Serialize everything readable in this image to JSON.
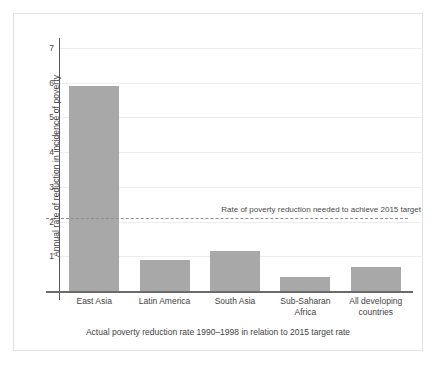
{
  "chart_data": {
    "type": "bar",
    "title": "",
    "subtitle": "",
    "xlabel": "Actual poverty reduction rate 1990–1998 in relation to 2015 target rate",
    "ylabel": "Annual rate of reduction in incidence of poverty",
    "categories": [
      "East Asia",
      "Latin America",
      "South Asia",
      "Sub-Saharan Africa",
      "All developing countries"
    ],
    "category_lines": [
      [
        "East Asia"
      ],
      [
        "Latin America"
      ],
      [
        "South Asia"
      ],
      [
        "Sub-Saharan",
        "Africa"
      ],
      [
        "All developing",
        "countries"
      ]
    ],
    "values": [
      5.9,
      0.9,
      1.15,
      0.4,
      0.7
    ],
    "ylim": [
      0,
      7.2
    ],
    "yticks": [
      1,
      2,
      3,
      4,
      5,
      6,
      7
    ],
    "ytick_labels": [
      "1",
      "2",
      "3",
      "4",
      "5",
      "6",
      "7"
    ],
    "grid": true,
    "legend": "none",
    "bar_color": "#a8a8a8",
    "gridline_color": "#ededed",
    "axis_color": "#6b6b6b",
    "annotations": [
      {
        "type": "reference-line",
        "value": 2.1,
        "style": "dashed",
        "color": "#8f8f8f",
        "label": "Rate of poverty reduction needed to achieve 2015 target"
      }
    ]
  },
  "figure": {
    "border_color": "#e2e2e2",
    "background": "#ffffff"
  }
}
